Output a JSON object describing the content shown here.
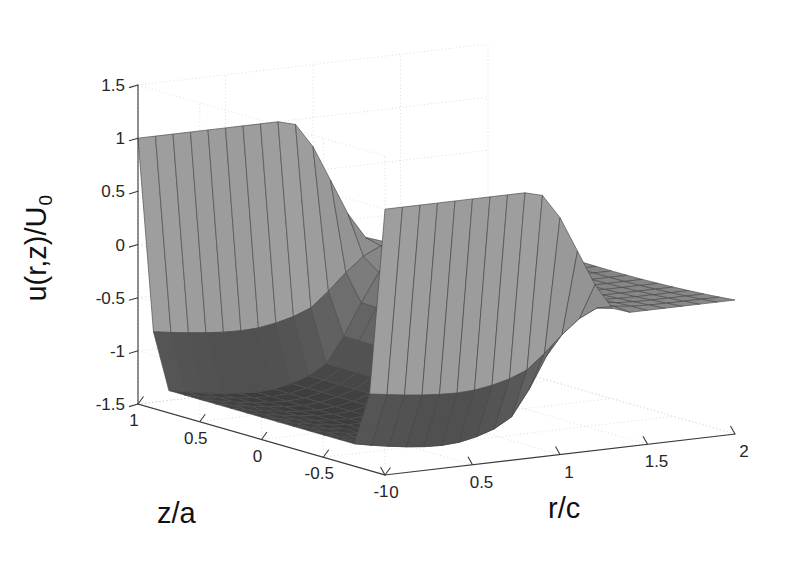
{
  "figure": {
    "background_color": "#ffffff",
    "width": 785,
    "height": 562,
    "type": "3d-surface-plot"
  },
  "chart_data": {
    "type": "surface",
    "title": "",
    "subtitle": "",
    "xlabel": "r/c",
    "ylabel": "z/a",
    "zlabel": "u(r,z)/U_0",
    "zlabel_base": "u(r,z)/U",
    "zlabel_subscript": "0",
    "xlim": [
      0,
      2
    ],
    "ylim": [
      -1,
      1
    ],
    "zlim": [
      -1.5,
      1.5
    ],
    "xticks": [
      0,
      0.5,
      1,
      1.5,
      2
    ],
    "xticklabels": [
      "0",
      "0.5",
      "1",
      "1.5",
      "2"
    ],
    "yticks": [
      1,
      0.5,
      0,
      -0.5,
      -1
    ],
    "yticklabels": [
      "1",
      "0.5",
      "0",
      "-0.5",
      "-1"
    ],
    "zticks": [
      1.5,
      1,
      0.5,
      0,
      -0.5,
      -1,
      -1.5
    ],
    "zticklabels": [
      "1.5",
      "1",
      "0.5",
      "0",
      "-0.5",
      "-1",
      "-1.5"
    ],
    "grid": true,
    "grid_style": "dotted",
    "grid_color": "#d8d8d8",
    "legend": "none",
    "colormap": "gray",
    "shading": "faceted",
    "mesh_edge_color": "#4a4a4a",
    "axis_color": "#3a3a3a",
    "view_azimuth_deg": -37.5,
    "view_elevation_deg": 30,
    "nx": 21,
    "ny": 17,
    "surface_model": {
      "plateau_value": -0.3,
      "inlet_value": 1.0,
      "trough_value": -1.45,
      "r_transition": 1.0,
      "r_transition_width": 0.16,
      "z_edge_taper": 0.82
    },
    "annotations": []
  },
  "axes": {
    "z_axis_name": "vertical-value-axis",
    "x_axis_name": "radial-axis",
    "y_axis_name": "axial-axis"
  }
}
